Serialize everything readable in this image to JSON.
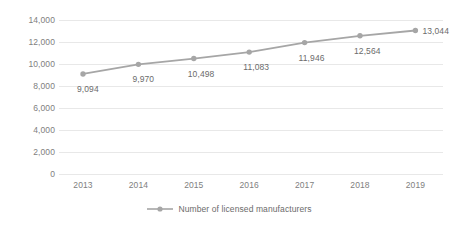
{
  "chart_data": {
    "type": "line",
    "title": "",
    "xlabel": "",
    "ylabel": "",
    "categories": [
      "2013",
      "2014",
      "2015",
      "2016",
      "2017",
      "2018",
      "2019"
    ],
    "series": [
      {
        "name": "Number of licensed manufacturers",
        "values": [
          9094,
          9970,
          10498,
          11083,
          11946,
          12564,
          13044
        ],
        "data_labels": [
          "9,094",
          "9,970",
          "10,498",
          "11,083",
          "11,946",
          "12,564",
          "13,044"
        ],
        "color": "#a6a6a6",
        "marker": "circle"
      }
    ],
    "ylim": [
      0,
      14000
    ],
    "y_ticks": [
      0,
      2000,
      4000,
      6000,
      8000,
      10000,
      12000,
      14000
    ],
    "y_tick_labels": [
      "0",
      "2,000",
      "4,000",
      "6,000",
      "8,000",
      "10,000",
      "12,000",
      "14,000"
    ],
    "grid": true,
    "grid_color": "#e8e8e8",
    "legend_position": "bottom",
    "axis_text_color": "#808080",
    "label_text_color": "#6b6b6b",
    "background": "#ffffff"
  },
  "legend": {
    "entries": [
      {
        "label": "Number of licensed manufacturers",
        "color": "#a6a6a6"
      }
    ]
  }
}
